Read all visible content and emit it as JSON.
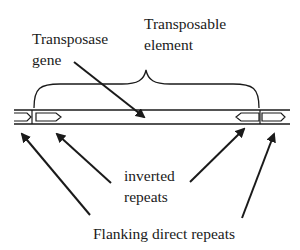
{
  "diagram": {
    "type": "transposon-structure",
    "labels": {
      "transposable_element": [
        "Transposable",
        "element"
      ],
      "transposase_gene": [
        "Transposase",
        "gene"
      ],
      "inverted_repeats": [
        "inverted",
        "repeats"
      ],
      "flanking_direct_repeats": "Flanking direct repeats"
    },
    "colors": {
      "ink": "#1a1a1a",
      "background": "#ffffff"
    }
  }
}
